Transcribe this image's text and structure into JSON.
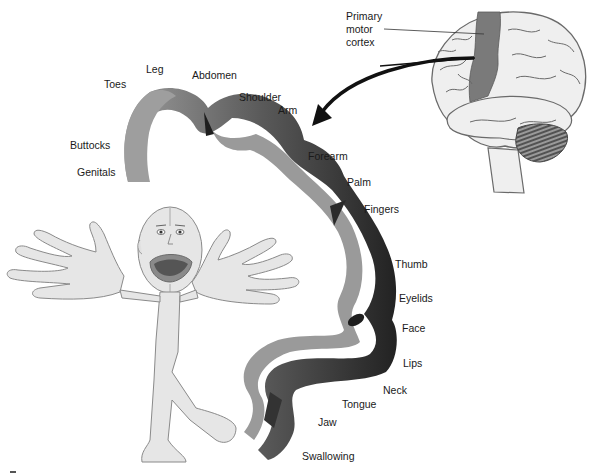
{
  "figure": {
    "colors": {
      "background": "#ffffff",
      "cortex_light": "#9a9a9a",
      "cortex_dark": "#2a2a2a",
      "motor_strip": "#7a7a7a",
      "brain_fill": "#efefef",
      "brain_outline": "#6a6a6a",
      "homunculus_fill": "#e6e6e6",
      "homunculus_outline": "#8a8a8a",
      "lips": "#8a8a8a",
      "mouth": "#555555",
      "arrow": "#111111"
    }
  },
  "brain": {
    "label_lines": [
      "Primary",
      "motor",
      "cortex"
    ],
    "label_full": "Primary motor cortex"
  },
  "cortex_labels": [
    {
      "text": "Toes",
      "x": 104,
      "y": 79
    },
    {
      "text": "Leg",
      "x": 146,
      "y": 64
    },
    {
      "text": "Abdomen",
      "x": 192,
      "y": 70
    },
    {
      "text": "Buttocks",
      "x": 70,
      "y": 140
    },
    {
      "text": "Shoulder",
      "x": 239,
      "y": 92
    },
    {
      "text": "Arm",
      "x": 278,
      "y": 105
    },
    {
      "text": "Genitals",
      "x": 77,
      "y": 167
    },
    {
      "text": "Forearm",
      "x": 308,
      "y": 151
    },
    {
      "text": "Palm",
      "x": 347,
      "y": 177
    },
    {
      "text": "Fingers",
      "x": 364,
      "y": 204
    },
    {
      "text": "Thumb",
      "x": 395,
      "y": 259
    },
    {
      "text": "Eyelids",
      "x": 399,
      "y": 293
    },
    {
      "text": "Face",
      "x": 402,
      "y": 323
    },
    {
      "text": "Lips",
      "x": 403,
      "y": 358
    },
    {
      "text": "Neck",
      "x": 383,
      "y": 385
    },
    {
      "text": "Tongue",
      "x": 342,
      "y": 399
    },
    {
      "text": "Jaw",
      "x": 318,
      "y": 417
    },
    {
      "text": "Swallowing",
      "x": 302,
      "y": 451
    }
  ]
}
